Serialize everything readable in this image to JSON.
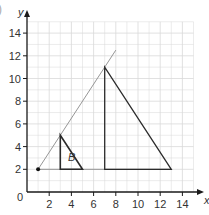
{
  "figure": {
    "partial_label": ")",
    "x_axis_label": "x",
    "y_axis_label": "y",
    "origin_label": "0",
    "shape_label": "B"
  },
  "chart_data": {
    "type": "diagram",
    "title": "",
    "xlabel": "x",
    "ylabel": "y",
    "xlim": [
      0,
      15
    ],
    "ylim": [
      0,
      15
    ],
    "grid": true,
    "x_ticks": [
      "2",
      "4",
      "6",
      "8",
      "10",
      "12",
      "14"
    ],
    "y_ticks": [
      "2",
      "4",
      "6",
      "8",
      "10",
      "12",
      "14"
    ],
    "center_of_enlargement": [
      1,
      2
    ],
    "shapes": [
      {
        "name": "B",
        "type": "triangle",
        "vertices": [
          [
            3,
            5
          ],
          [
            3,
            2
          ],
          [
            5,
            2
          ]
        ]
      },
      {
        "name": "image",
        "type": "triangle",
        "vertices": [
          [
            7,
            11
          ],
          [
            7,
            2
          ],
          [
            13,
            2
          ]
        ]
      }
    ],
    "ray": {
      "from": [
        1,
        2
      ],
      "to": [
        8,
        12.5
      ]
    },
    "colors": {
      "axis": "#1a1a1a",
      "grid": "#d9d9d9",
      "shape": "#2b2b2b",
      "ray": "#8a8a8a"
    }
  }
}
